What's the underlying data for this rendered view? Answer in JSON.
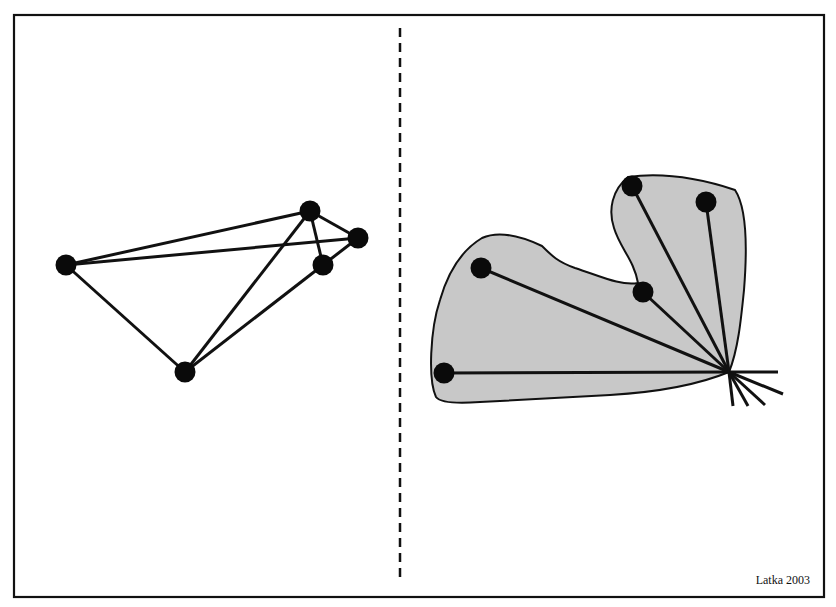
{
  "figure": {
    "caption": "Latka 2003",
    "frame": {
      "x": 14,
      "y": 15,
      "width": 810,
      "height": 582
    },
    "divider": {
      "x": 400,
      "y1": 28,
      "y2": 582,
      "style": "dashed"
    },
    "colors": {
      "line": "#111111",
      "node": "#0a0a0a",
      "region_fill": "#c8c8c8",
      "background": "#ffffff"
    },
    "left_panel": {
      "description": "network graph of nodes connected by edges",
      "nodes": [
        {
          "id": "A",
          "x": 66,
          "y": 265
        },
        {
          "id": "B",
          "x": 310,
          "y": 211
        },
        {
          "id": "C",
          "x": 358,
          "y": 238
        },
        {
          "id": "D",
          "x": 323,
          "y": 265
        },
        {
          "id": "E",
          "x": 185,
          "y": 372
        }
      ],
      "edges": [
        [
          "A",
          "B"
        ],
        [
          "A",
          "C"
        ],
        [
          "A",
          "E"
        ],
        [
          "B",
          "C"
        ],
        [
          "B",
          "D"
        ],
        [
          "B",
          "E"
        ],
        [
          "C",
          "D"
        ],
        [
          "D",
          "E"
        ]
      ]
    },
    "right_panel": {
      "description": "shaded region with nodes all linked to a single hub point, plus outward stubs",
      "hub": {
        "x": 729,
        "y": 372
      },
      "region_path": "M 436 397 C 428 380 430 330 440 300 C 448 272 462 250 482 238 C 500 230 525 238 542 246 C 552 256 558 262 575 268 C 600 276 620 286 638 283 C 634 260 620 248 614 228 C 608 210 612 190 628 177 C 665 172 705 180 735 190 C 745 205 748 240 744 290 C 741 320 738 350 729 372 C 700 384 660 392 610 395 C 560 398 520 400 480 402 C 455 404 440 402 436 397 Z",
      "nodes": [
        {
          "id": "P1",
          "x": 444,
          "y": 373
        },
        {
          "id": "P2",
          "x": 481,
          "y": 268
        },
        {
          "id": "P3",
          "x": 643,
          "y": 292
        },
        {
          "id": "P4",
          "x": 632,
          "y": 186
        },
        {
          "id": "P5",
          "x": 706,
          "y": 202
        }
      ],
      "stubs": [
        {
          "x": 778,
          "y": 372
        },
        {
          "x": 783,
          "y": 394
        },
        {
          "x": 765,
          "y": 405
        },
        {
          "x": 748,
          "y": 406
        },
        {
          "x": 733,
          "y": 406
        }
      ]
    }
  }
}
